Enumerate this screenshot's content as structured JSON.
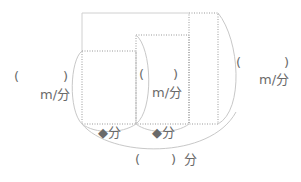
{
  "diagram": {
    "type": "area-diagram",
    "colors": {
      "line": "#c8c8c8",
      "dotted": "#999999",
      "text": "#6a6a6a"
    },
    "rects": [
      {
        "name": "rect-1",
        "x": 82,
        "y": 51,
        "w": 54,
        "h": 73
      },
      {
        "name": "rect-2",
        "x": 136,
        "y": 35,
        "w": 53,
        "h": 89
      },
      {
        "name": "rect-3",
        "x": 189,
        "y": 13,
        "w": 29,
        "h": 111
      }
    ],
    "labels": {
      "speed1_open": "(",
      "speed1_close": ")",
      "speed1_unit": "m/分",
      "speed2_open": "(",
      "speed2_close": ")",
      "speed2_unit": "m/分",
      "speed3_open": "(",
      "speed3_close": ")",
      "speed3_unit": "m/分",
      "time1": "◆分",
      "time2": "◆分",
      "total_open": "(",
      "total_close": ")",
      "total_unit": "分"
    }
  }
}
